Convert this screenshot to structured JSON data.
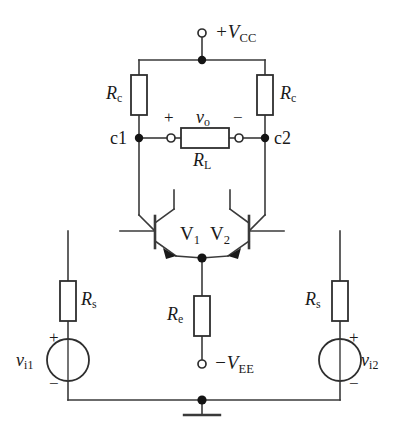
{
  "diagram": {
    "type": "circuit-schematic",
    "colors": {
      "background": "#ffffff",
      "wire": "#3a3a3a",
      "node": "#141414",
      "text": "#1a1a1a"
    }
  },
  "supplies": {
    "positive": {
      "label": "+V",
      "subscript": "CC",
      "terminal": "open-circle"
    },
    "negative": {
      "label": "−V",
      "subscript": "EE",
      "terminal": "open-circle"
    },
    "ground": {
      "label": "",
      "symbol": "ground-bar"
    }
  },
  "nodes": {
    "collector_left": "c1",
    "collector_right": "c2"
  },
  "transistors": [
    {
      "name": "V",
      "subscript": "1",
      "kind": "npn",
      "orientation": "base-left"
    },
    {
      "name": "V",
      "subscript": "2",
      "kind": "npn",
      "orientation": "base-right"
    }
  ],
  "resistors": [
    {
      "id": "rc-left",
      "label": "R",
      "subscript": "c",
      "orientation": "vertical",
      "label_side": "left"
    },
    {
      "id": "rc-right",
      "label": "R",
      "subscript": "c",
      "orientation": "vertical",
      "label_side": "right"
    },
    {
      "id": "rl",
      "label": "R",
      "subscript": "L",
      "orientation": "horizontal",
      "label_side": "below"
    },
    {
      "id": "re",
      "label": "R",
      "subscript": "e",
      "orientation": "vertical",
      "label_side": "left"
    },
    {
      "id": "rs-left",
      "label": "R",
      "subscript": "s",
      "orientation": "vertical",
      "label_side": "right"
    },
    {
      "id": "rs-right",
      "label": "R",
      "subscript": "s",
      "orientation": "vertical",
      "label_side": "left"
    }
  ],
  "output": {
    "label": "v",
    "subscript": "o",
    "plus": "+",
    "minus": "−",
    "terminals": "open-circle"
  },
  "sources": [
    {
      "id": "vi1",
      "label": "v",
      "subscript": "i1",
      "plus": "+",
      "minus": "−",
      "label_side": "left",
      "shape": "circle-with-bar"
    },
    {
      "id": "vi2",
      "label": "v",
      "subscript": "i2",
      "plus": "+",
      "minus": "−",
      "label_side": "right",
      "shape": "circle-with-bar"
    }
  ]
}
